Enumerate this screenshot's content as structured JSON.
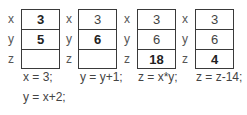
{
  "diagram": {
    "panels": [
      {
        "cells": [
          {
            "name": "x",
            "value": "3",
            "bold": true
          },
          {
            "name": "y",
            "value": "5",
            "bold": true
          },
          {
            "name": "z",
            "value": "",
            "bold": false
          }
        ],
        "code": [
          "x = 3;",
          "y =  x+2;"
        ]
      },
      {
        "cells": [
          {
            "name": "x",
            "value": "3",
            "bold": false
          },
          {
            "name": "y",
            "value": "6",
            "bold": true
          },
          {
            "name": "z",
            "value": "",
            "bold": false
          }
        ],
        "code": [
          "y = y+1;"
        ]
      },
      {
        "cells": [
          {
            "name": "x",
            "value": "3",
            "bold": false
          },
          {
            "name": "y",
            "value": "6",
            "bold": false
          },
          {
            "name": "z",
            "value": "18",
            "bold": true
          }
        ],
        "code": [
          "z = x*y;"
        ]
      },
      {
        "cells": [
          {
            "name": "x",
            "value": "3",
            "bold": false
          },
          {
            "name": "y",
            "value": "6",
            "bold": false
          },
          {
            "name": "z",
            "value": "4",
            "bold": true
          }
        ],
        "code": [
          "z = z-14;"
        ]
      }
    ]
  }
}
